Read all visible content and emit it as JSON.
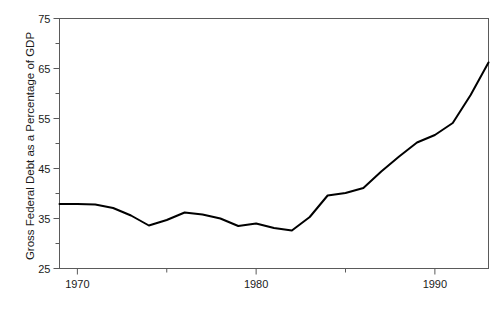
{
  "chart_data": {
    "type": "line",
    "title": "",
    "subtitle": "",
    "xlabel": "",
    "ylabel": "Gross Federal Debt as a Percentage of GDP",
    "xlim": [
      1969,
      1993
    ],
    "ylim": [
      25,
      75
    ],
    "grid": false,
    "legend": null,
    "axis": {
      "y_major_ticks": [
        25,
        35,
        45,
        55,
        65,
        75
      ],
      "y_major_tick_labels": [
        "25",
        "35",
        "45",
        "55",
        "65",
        "75"
      ],
      "y_minor_ticks": [
        30,
        40,
        50,
        60,
        70
      ],
      "x_major_ticks": [
        1970,
        1980,
        1990
      ],
      "x_major_tick_labels": [
        "1970",
        "1980",
        "1990"
      ],
      "x_minor_ticks": [
        1975,
        1985
      ],
      "tick_direction": "out",
      "frame": "box"
    },
    "series": [
      {
        "name": "Gross Federal Debt as a Percentage of GDP",
        "color": "#000000",
        "line_width": 2,
        "x": [
          1969,
          1970,
          1971,
          1972,
          1973,
          1974,
          1975,
          1976,
          1977,
          1978,
          1979,
          1980,
          1981,
          1982,
          1983,
          1984,
          1985,
          1986,
          1987,
          1988,
          1989,
          1990,
          1991,
          1992,
          1993
        ],
        "values": [
          37.9,
          37.9,
          37.8,
          37.1,
          35.6,
          33.6,
          34.7,
          36.2,
          35.8,
          35.0,
          33.5,
          34.0,
          33.1,
          32.6,
          35.3,
          39.6,
          40.1,
          41.1,
          44.4,
          47.4,
          50.2,
          51.7,
          54.1,
          59.7,
          66.2
        ]
      }
    ]
  }
}
